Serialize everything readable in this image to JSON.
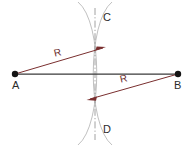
{
  "figure": {
    "background_color": "#ffffff",
    "width": 193,
    "height": 147,
    "points": [
      {
        "id": "A",
        "label": "A",
        "x": 15,
        "y": 74
      },
      {
        "id": "B",
        "label": "B",
        "x": 178,
        "y": 74
      },
      {
        "id": "C",
        "label": "C",
        "x": 95,
        "y": 17
      },
      {
        "id": "D",
        "label": "D",
        "x": 95,
        "y": 130
      }
    ],
    "segments": [
      {
        "id": "AB",
        "from": "A",
        "to": "B",
        "color": "#3a3a3a",
        "style": "solid"
      },
      {
        "id": "CD",
        "from": "C",
        "to": "D",
        "color": "#6b6b6b",
        "style": "dash-dot"
      }
    ],
    "radius_labels": [
      {
        "id": "R1",
        "label": "R",
        "color": "#7a2f2f"
      },
      {
        "id": "R2",
        "label": "R",
        "color": "#7a2f2f"
      }
    ],
    "arcs": [
      {
        "id": "arc-from-A",
        "center": "A",
        "color": "#b8b8b8"
      },
      {
        "id": "arc-from-B",
        "center": "B",
        "color": "#b8b8b8"
      }
    ],
    "colors": {
      "point": "#1a1a1a",
      "baseline": "#3a3a3a",
      "arc": "#b8b8b8",
      "radius": "#7a2f2f",
      "axis": "#777777",
      "label": "#2b2b2b"
    }
  }
}
